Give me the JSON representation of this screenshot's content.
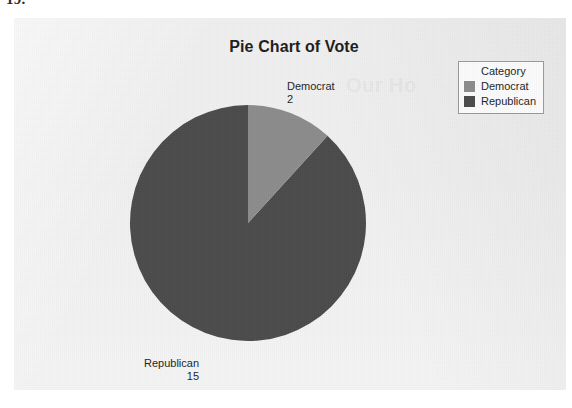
{
  "page": {
    "number_fragment": "19."
  },
  "ghost": {
    "text": "Our Ho"
  },
  "chart_data": {
    "type": "pie",
    "title": "Pie Chart of Vote",
    "categories": [
      "Democrat",
      "Republican"
    ],
    "values": [
      2,
      15
    ],
    "total": 17,
    "legend_title": "Category",
    "legend_position": "top-right",
    "start_angle_deg": 0,
    "direction": "clockwise",
    "colors": [
      "#8c8c8c",
      "#4b4b4b"
    ],
    "slices": [
      {
        "label": "Democrat",
        "value": 2,
        "percent": 11.8,
        "angle_deg": 42.4,
        "color": "#8c8c8c"
      },
      {
        "label": "Republican",
        "value": 15,
        "percent": 88.2,
        "angle_deg": 317.6,
        "color": "#4b4b4b"
      }
    ],
    "data_labels": [
      {
        "name": "Democrat",
        "value": "2"
      },
      {
        "name": "Republican",
        "value": "15"
      }
    ],
    "xlabel": "",
    "ylabel": "",
    "grid": false
  },
  "colors": {
    "panel_background": "#f0f0f0",
    "democrat": "#8c8c8c",
    "republican": "#4b4b4b",
    "legend_border": "#9a9a9a",
    "text": "#1f1f1f"
  }
}
